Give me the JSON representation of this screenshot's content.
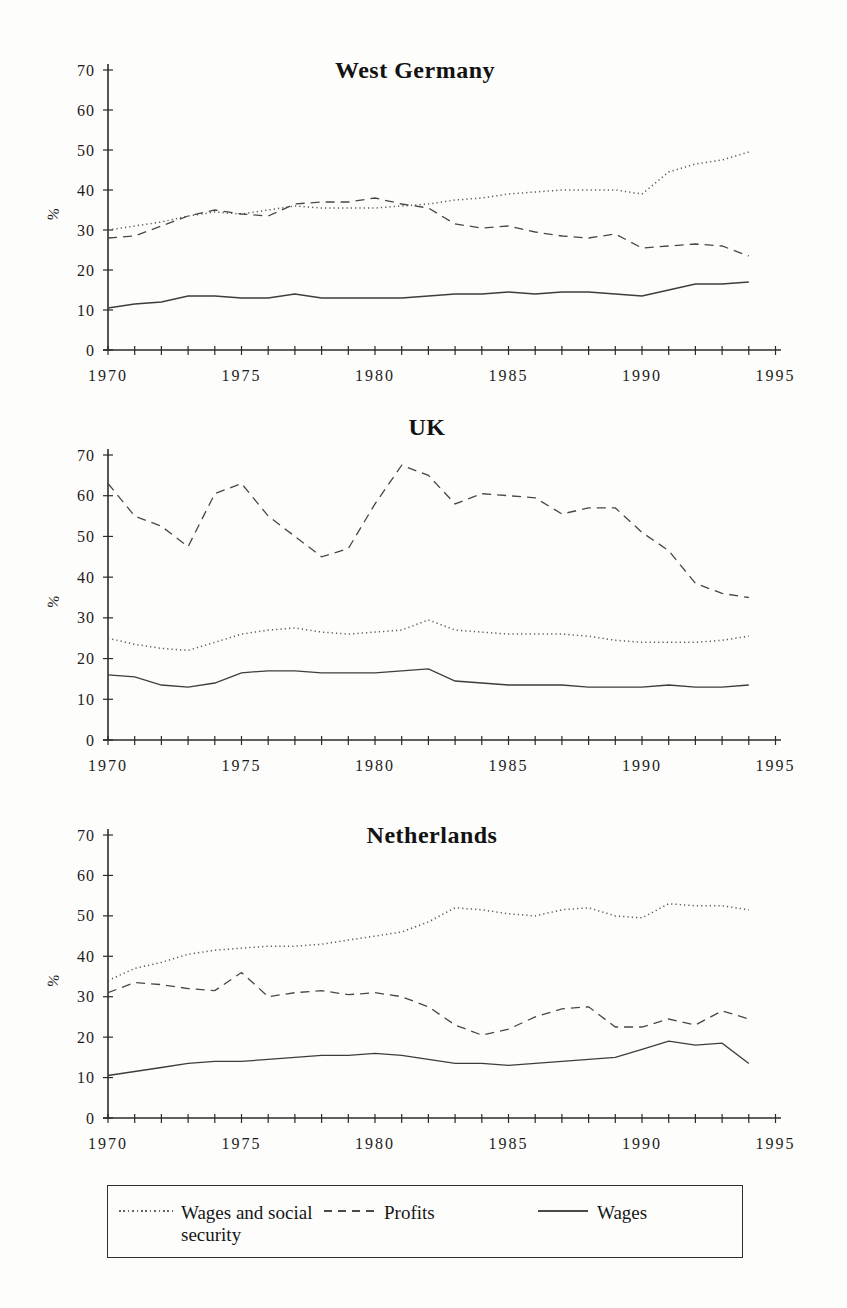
{
  "page": {
    "background": "#fdfdfb",
    "ink": "#1c1c1c",
    "line_color": "#3d3d3d"
  },
  "legend": {
    "items": [
      {
        "label": "Wages and social security",
        "style": "dotted"
      },
      {
        "label": "Profits",
        "style": "dashed"
      },
      {
        "label": "Wages",
        "style": "solid"
      }
    ]
  },
  "chart_data": [
    {
      "type": "line",
      "title": "West Germany",
      "ylabel": "%",
      "ylim": [
        0,
        70
      ],
      "yticks": [
        0,
        10,
        20,
        30,
        40,
        50,
        60,
        70
      ],
      "xlim": [
        1970,
        1995
      ],
      "xticks_labeled": [
        1970,
        1975,
        1980,
        1985,
        1990,
        1995
      ],
      "grid": false,
      "x": [
        1970,
        1971,
        1972,
        1973,
        1974,
        1975,
        1976,
        1977,
        1978,
        1979,
        1980,
        1981,
        1982,
        1983,
        1984,
        1985,
        1986,
        1987,
        1988,
        1989,
        1990,
        1991,
        1992,
        1993,
        1994
      ],
      "series": [
        {
          "name": "Wages and social security",
          "style": "dotted",
          "values": [
            30,
            31,
            32,
            33.5,
            34.5,
            34,
            35,
            36,
            35.5,
            35.5,
            35.5,
            36,
            36.5,
            37.5,
            38,
            39,
            39.5,
            40,
            40,
            40,
            39,
            44.5,
            46.5,
            47.5,
            49.5
          ]
        },
        {
          "name": "Profits",
          "style": "dashed",
          "values": [
            28,
            28.5,
            31,
            33.5,
            35,
            34,
            33.5,
            36.5,
            37,
            37,
            38,
            36.5,
            35.5,
            31.5,
            30.5,
            31,
            29.5,
            28.5,
            28,
            29,
            25.5,
            26,
            26.5,
            26,
            23.5
          ]
        },
        {
          "name": "Wages",
          "style": "solid",
          "values": [
            10.5,
            11.5,
            12,
            13.5,
            13.5,
            13,
            13,
            14,
            13,
            13,
            13,
            13,
            13.5,
            14,
            14,
            14.5,
            14,
            14.5,
            14.5,
            14,
            13.5,
            15,
            16.5,
            16.5,
            17
          ]
        }
      ]
    },
    {
      "type": "line",
      "title": "UK",
      "ylabel": "%",
      "ylim": [
        0,
        70
      ],
      "yticks": [
        0,
        10,
        20,
        30,
        40,
        50,
        60,
        70
      ],
      "xlim": [
        1970,
        1995
      ],
      "xticks_labeled": [
        1970,
        1975,
        1980,
        1985,
        1990,
        1995
      ],
      "grid": false,
      "x": [
        1970,
        1971,
        1972,
        1973,
        1974,
        1975,
        1976,
        1977,
        1978,
        1979,
        1980,
        1981,
        1982,
        1983,
        1984,
        1985,
        1986,
        1987,
        1988,
        1989,
        1990,
        1991,
        1992,
        1993,
        1994
      ],
      "series": [
        {
          "name": "Wages and social security",
          "style": "dotted",
          "values": [
            25,
            23.5,
            22.5,
            22,
            24,
            26,
            27,
            27.5,
            26.5,
            26,
            26.5,
            27,
            29.5,
            27,
            26.5,
            26,
            26,
            26,
            25.5,
            24.5,
            24,
            24,
            24,
            24.5,
            25.5
          ]
        },
        {
          "name": "Profits",
          "style": "dashed",
          "values": [
            63,
            55,
            52.5,
            47.5,
            60.5,
            63,
            55,
            50,
            45,
            47,
            58,
            67.5,
            65,
            58,
            60.5,
            60,
            59.5,
            55.5,
            57,
            57,
            51,
            46.5,
            38.5,
            36,
            35
          ]
        },
        {
          "name": "Wages",
          "style": "solid",
          "values": [
            16,
            15.5,
            13.5,
            13,
            14,
            16.5,
            17,
            17,
            16.5,
            16.5,
            16.5,
            17,
            17.5,
            14.5,
            14,
            13.5,
            13.5,
            13.5,
            13,
            13,
            13,
            13.5,
            13,
            13,
            13.5
          ]
        }
      ]
    },
    {
      "type": "line",
      "title": "Netherlands",
      "ylabel": "%",
      "ylim": [
        0,
        70
      ],
      "yticks": [
        0,
        10,
        20,
        30,
        40,
        50,
        60,
        70
      ],
      "xlim": [
        1970,
        1995
      ],
      "xticks_labeled": [
        1970,
        1975,
        1980,
        1985,
        1990,
        1995
      ],
      "grid": false,
      "x": [
        1970,
        1971,
        1972,
        1973,
        1974,
        1975,
        1976,
        1977,
        1978,
        1979,
        1980,
        1981,
        1982,
        1983,
        1984,
        1985,
        1986,
        1987,
        1988,
        1989,
        1990,
        1991,
        1992,
        1993,
        1994
      ],
      "series": [
        {
          "name": "Wages and social security",
          "style": "dotted",
          "values": [
            34,
            37,
            38.5,
            40.5,
            41.5,
            42,
            42.5,
            42.5,
            43,
            44,
            45,
            46,
            48.5,
            52,
            51.5,
            50.5,
            50,
            51.5,
            52,
            50,
            49.5,
            53,
            52.5,
            52.5,
            51.5
          ]
        },
        {
          "name": "Profits",
          "style": "dashed",
          "values": [
            31,
            33.5,
            33,
            32,
            31.5,
            36,
            30,
            31,
            31.5,
            30.5,
            31,
            30,
            27.5,
            23,
            20.5,
            22,
            25,
            27,
            27.5,
            22.5,
            22.5,
            24.5,
            23,
            26.5,
            24.5
          ]
        },
        {
          "name": "Wages",
          "style": "solid",
          "values": [
            10.5,
            11.5,
            12.5,
            13.5,
            14,
            14,
            14.5,
            15,
            15.5,
            15.5,
            16,
            15.5,
            14.5,
            13.5,
            13.5,
            13,
            13.5,
            14,
            14.5,
            15,
            17,
            19,
            18,
            18.5,
            13.5
          ]
        }
      ]
    }
  ]
}
